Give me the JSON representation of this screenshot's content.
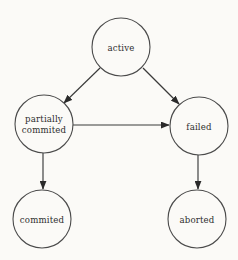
{
  "diagram": {
    "background_color": "#fbfaf7",
    "node_stroke_color": "#4a4a4a",
    "edge_color": "#3a3a3a",
    "label_color": "#2e2e2e",
    "nodes": [
      {
        "id": "active",
        "label": "active",
        "label_lines": [
          "active"
        ],
        "cx": 121,
        "cy": 47,
        "r": 29
      },
      {
        "id": "partially-committed",
        "label": "partially commited",
        "label_lines": [
          "partially",
          "commited"
        ],
        "cx": 44,
        "cy": 124,
        "r": 29
      },
      {
        "id": "failed",
        "label": "failed",
        "label_lines": [
          "failed"
        ],
        "cx": 199,
        "cy": 126,
        "r": 29
      },
      {
        "id": "committed",
        "label": "commited",
        "label_lines": [
          "commited"
        ],
        "cx": 42,
        "cy": 219,
        "r": 29
      },
      {
        "id": "aborted",
        "label": "aborted",
        "label_lines": [
          "aborted"
        ],
        "cx": 197,
        "cy": 219,
        "r": 29
      }
    ],
    "edges": [
      {
        "id": "active-to-partially-committed",
        "from": "active",
        "to": "partially-committed",
        "label": "",
        "x1": 100,
        "y1": 68,
        "x2": 63,
        "y2": 104
      },
      {
        "id": "active-to-failed",
        "from": "active",
        "to": "failed",
        "label": "",
        "x1": 143,
        "y1": 68,
        "x2": 180,
        "y2": 105
      },
      {
        "id": "partially-committed-to-failed",
        "from": "partially-committed",
        "to": "failed",
        "label": "",
        "x1": 73,
        "y1": 125,
        "x2": 170,
        "y2": 125
      },
      {
        "id": "partially-committed-to-committed",
        "from": "partially-committed",
        "to": "committed",
        "label": "",
        "x1": 43,
        "y1": 153,
        "x2": 43,
        "y2": 190
      },
      {
        "id": "failed-to-aborted",
        "from": "failed",
        "to": "aborted",
        "label": "",
        "x1": 198,
        "y1": 155,
        "x2": 198,
        "y2": 190
      }
    ]
  }
}
